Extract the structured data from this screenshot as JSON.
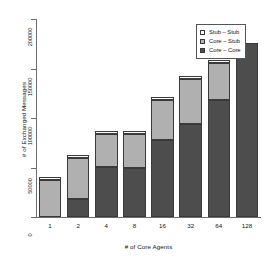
{
  "chart_data": {
    "type": "bar",
    "stacked": true,
    "title": "",
    "xlabel": "# of Core Agents",
    "ylabel": "# of Exchanged Messages",
    "categories": [
      "1",
      "2",
      "4",
      "8",
      "16",
      "32",
      "64",
      "128"
    ],
    "series": [
      {
        "name": "Core – Core",
        "color": "#4d4d4d",
        "values": [
          0,
          18000,
          51000,
          50000,
          78000,
          94000,
          118000,
          176000
        ]
      },
      {
        "name": "Core – Stub",
        "color": "#b0b0b0",
        "values": [
          37000,
          42000,
          33000,
          34000,
          40000,
          45000,
          38000,
          0
        ]
      },
      {
        "name": "Stub – Stub",
        "color": "#ffffff",
        "values": [
          3000,
          3000,
          3000,
          3000,
          3000,
          3000,
          3000,
          0
        ]
      }
    ],
    "totals": [
      40000,
      63000,
      87000,
      87000,
      121000,
      142000,
      159000,
      176000
    ],
    "ylim": [
      0,
      200000
    ],
    "yticks": [
      0,
      50000,
      100000,
      150000,
      200000
    ],
    "ytick_labels": [
      "0",
      "50000",
      "100000",
      "150000",
      "200000"
    ],
    "grid": false,
    "legend_position": "top-right",
    "legend": [
      "Stub – Stub",
      "Core – Stub",
      "Core – Core"
    ]
  }
}
